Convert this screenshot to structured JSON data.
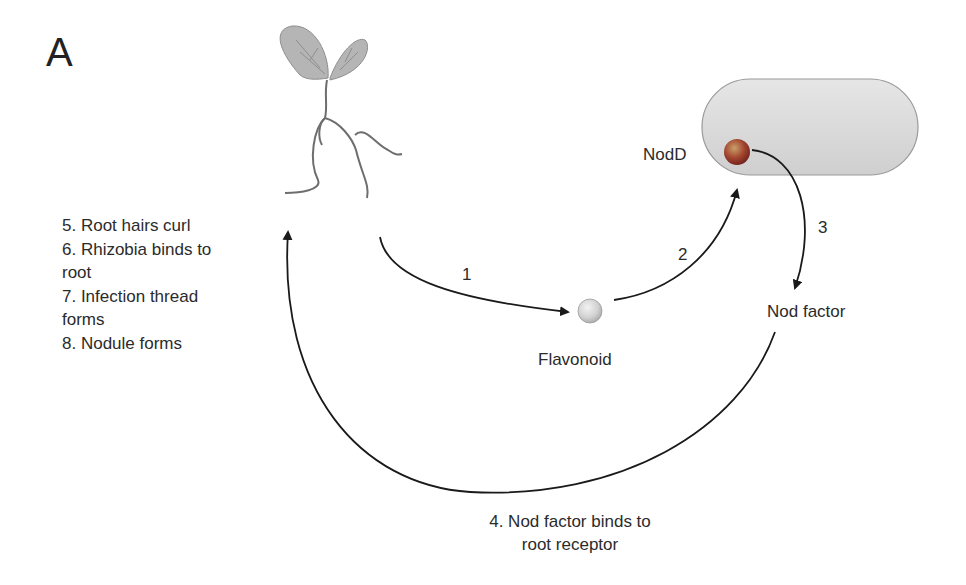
{
  "panel_letter": "A",
  "plant": {
    "icon": "seedling-icon",
    "leaf_color": "#b3b3b3",
    "stem_color": "#6e6e6e"
  },
  "bacterium": {
    "icon": "rhizobium-cell-icon",
    "fill": "#d9d9d9",
    "stroke": "#9a9a9a"
  },
  "nodes": {
    "nodd": {
      "label": "NodD",
      "color": "#8b2b26"
    },
    "flavonoid": {
      "label": "Flavonoid",
      "color": "#d0d0d0"
    },
    "nod_factor": {
      "label": "Nod factor"
    }
  },
  "arrows": {
    "step1": "1",
    "step2": "2",
    "step3": "3",
    "step4_line1": "4. Nod factor binds to",
    "step4_line2": "root receptor"
  },
  "steps_list": [
    "5. Root hairs curl",
    "6. Rhizobia binds to",
    "root",
    "7. Infection thread",
    "forms",
    "8. Nodule forms"
  ]
}
